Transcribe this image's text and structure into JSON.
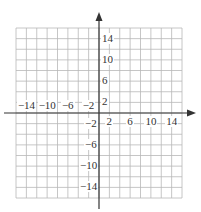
{
  "chart_data": {
    "type": "line",
    "title": "",
    "xlabel": "",
    "ylabel": "",
    "xlim": [
      -16,
      16
    ],
    "ylim": [
      -16,
      16
    ],
    "grid": true,
    "grid_step": 2,
    "x_tick_labels": [
      "-14",
      "-10",
      "-6",
      "-2",
      "2",
      "6",
      "10",
      "14"
    ],
    "x_ticks": [
      -14,
      -10,
      -6,
      -2,
      2,
      6,
      10,
      14
    ],
    "y_tick_labels": [
      "14",
      "10",
      "6",
      "2",
      "-2",
      "-6",
      "-10",
      "-14"
    ],
    "y_ticks": [
      14,
      10,
      6,
      2,
      -2,
      -6,
      -10,
      -14
    ],
    "series": [],
    "legend": null
  },
  "colors": {
    "grid": "#b8b8b8",
    "axis": "#333333"
  }
}
